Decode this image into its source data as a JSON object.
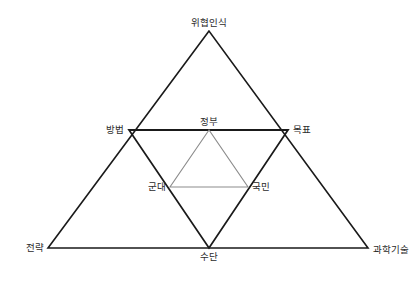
{
  "diagram": {
    "type": "nested-triangle-diagram",
    "background_color": "#ffffff",
    "outer_stroke_color": "#1a1a1a",
    "middle_stroke_color": "#1a1a1a",
    "inner_stroke_color": "#8c8c8c",
    "text_color": "#2b2b2b",
    "labels": {
      "apex": "위협인식",
      "middle_left": "방법",
      "middle_center": "정부",
      "middle_right": "목표",
      "inner_left": "군대",
      "inner_right": "국민",
      "bottom_left": "전략",
      "bottom_center": "수단",
      "bottom_right": "과학기술"
    },
    "nodes": [
      {
        "id": "apex",
        "label": "위협인식",
        "x": 209,
        "y": 31,
        "anchor": "center-above"
      },
      {
        "id": "middle-left",
        "label": "방법",
        "x": 129,
        "y": 130,
        "anchor": "left-of"
      },
      {
        "id": "middle-center",
        "label": "정부",
        "x": 209,
        "y": 130,
        "anchor": "center-above"
      },
      {
        "id": "middle-right",
        "label": "목표",
        "x": 288,
        "y": 130,
        "anchor": "right-of"
      },
      {
        "id": "inner-left",
        "label": "군대",
        "x": 170,
        "y": 187,
        "anchor": "left-of"
      },
      {
        "id": "inner-right",
        "label": "국민",
        "x": 248,
        "y": 187,
        "anchor": "right-of"
      },
      {
        "id": "bottom-left",
        "label": "전략",
        "x": 48,
        "y": 248,
        "anchor": "left-of"
      },
      {
        "id": "bottom-center",
        "label": "수단",
        "x": 209,
        "y": 248,
        "anchor": "center-below"
      },
      {
        "id": "bottom-right",
        "label": "과학기술",
        "x": 368,
        "y": 248,
        "anchor": "right-of"
      }
    ],
    "shapes": [
      {
        "id": "outer-triangle",
        "orientation": "upward",
        "points": "209,31 48,248 368,248",
        "stroke": "#1a1a1a",
        "stroke_width": 1.6,
        "vertices": [
          "위협인식",
          "전략",
          "과학기술"
        ]
      },
      {
        "id": "middle-triangle",
        "orientation": "downward",
        "points": "129,130 288,130 209,248",
        "stroke": "#1a1a1a",
        "stroke_width": 1.8,
        "vertices": [
          "방법",
          "목표",
          "수단"
        ]
      },
      {
        "id": "inner-triangle",
        "orientation": "upward",
        "points": "209,130 170,187 248,187",
        "stroke": "#8c8c8c",
        "stroke_width": 1.1,
        "vertices": [
          "정부",
          "군대",
          "국민"
        ]
      }
    ]
  }
}
